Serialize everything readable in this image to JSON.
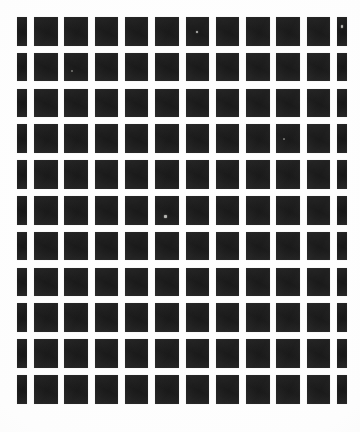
{
  "image": {
    "title": "Checkerboard calibration pattern",
    "kind": "photographed print",
    "width_px": 360,
    "height_px": 432,
    "background_color": "#fdfdfd",
    "tile_color": "#1c1c1c",
    "edge_tile_color": "#191919"
  },
  "grid": {
    "columns": 11,
    "rows": 11,
    "origin_x_px": 17,
    "origin_y_px": 17,
    "column_pitch_px": 30.3,
    "row_pitch_px": 35.8,
    "tile_width_px": 23.5,
    "tile_height_px": 28.5,
    "edge_tile_width_px": 10,
    "gap_px": 7,
    "left_margin_px": 17,
    "right_margin_px": 10,
    "top_margin_px": 17,
    "bottom_margin_px": 22,
    "columns_clipped": [
      "first",
      "last"
    ],
    "description": "Eleven columns by eleven rows of dark squares on a white field; the leftmost and rightmost columns are cropped to narrow slivers by the image frame."
  },
  "columns": [
    {
      "index": 0,
      "x_px": 17,
      "width_px": 10,
      "clipped": true
    },
    {
      "index": 1,
      "x_px": 34,
      "width_px": 23.5,
      "clipped": false
    },
    {
      "index": 2,
      "x_px": 64.3,
      "width_px": 23.5,
      "clipped": false
    },
    {
      "index": 3,
      "x_px": 94.6,
      "width_px": 23.5,
      "clipped": false
    },
    {
      "index": 4,
      "x_px": 124.9,
      "width_px": 23.5,
      "clipped": false
    },
    {
      "index": 5,
      "x_px": 155.2,
      "width_px": 23.5,
      "clipped": false
    },
    {
      "index": 6,
      "x_px": 185.5,
      "width_px": 23.5,
      "clipped": false
    },
    {
      "index": 7,
      "x_px": 215.8,
      "width_px": 23.5,
      "clipped": false
    },
    {
      "index": 8,
      "x_px": 246.1,
      "width_px": 23.5,
      "clipped": false
    },
    {
      "index": 9,
      "x_px": 276.4,
      "width_px": 23.5,
      "clipped": false
    },
    {
      "index": 10,
      "x_px": 306.7,
      "width_px": 23.5,
      "clipped": false
    },
    {
      "index": 11,
      "x_px": 337,
      "width_px": 10,
      "clipped": true
    }
  ],
  "rows": [
    {
      "index": 0,
      "y_px": 17
    },
    {
      "index": 1,
      "y_px": 52.8
    },
    {
      "index": 2,
      "y_px": 88.6
    },
    {
      "index": 3,
      "y_px": 124.4
    },
    {
      "index": 4,
      "y_px": 160.2
    },
    {
      "index": 5,
      "y_px": 196
    },
    {
      "index": 6,
      "y_px": 231.8
    },
    {
      "index": 7,
      "y_px": 267.6
    },
    {
      "index": 8,
      "y_px": 303.4
    },
    {
      "index": 9,
      "y_px": 339.2
    },
    {
      "index": 10,
      "y_px": 375
    }
  ],
  "artifacts": [
    {
      "name": "speck-row0-col6",
      "x_px": 196,
      "y_px": 31,
      "size_px": 2.4,
      "style": "bright"
    },
    {
      "name": "speck-row0-col11",
      "x_px": 340.5,
      "y_px": 25,
      "size_px": 2.8,
      "style": "bright"
    },
    {
      "name": "speck-row5-col5",
      "x_px": 164,
      "y_px": 215,
      "size_px": 2.6,
      "style": "bright"
    },
    {
      "name": "speck-row1-col2",
      "x_px": 71,
      "y_px": 70,
      "size_px": 1.6,
      "style": "dim"
    },
    {
      "name": "speck-row3-col9",
      "x_px": 283,
      "y_px": 138,
      "size_px": 1.5,
      "style": "dim"
    }
  ]
}
